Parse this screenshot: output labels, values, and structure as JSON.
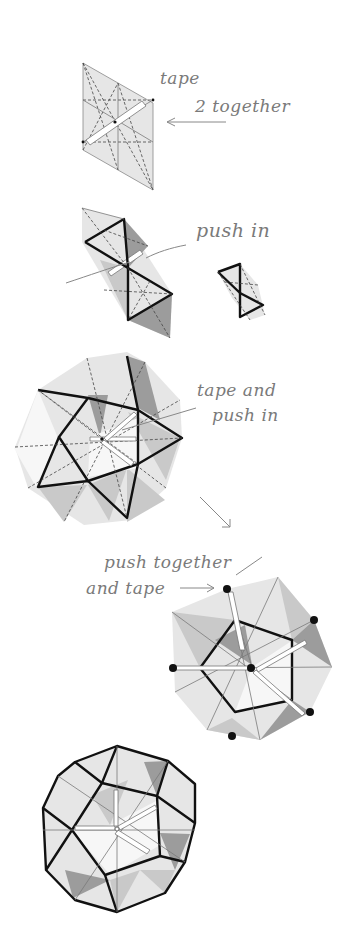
{
  "diagram": {
    "type": "assembly instructions",
    "steps": [
      {
        "id": 1,
        "labels": [
          "tape",
          "2 together"
        ]
      },
      {
        "id": 2,
        "labels": [
          "push in"
        ]
      },
      {
        "id": 3,
        "labels": [
          "tape and",
          "push in"
        ]
      },
      {
        "id": 4,
        "labels": [
          "push together",
          "and tape"
        ]
      },
      {
        "id": 5,
        "labels": []
      }
    ]
  },
  "colors": {
    "light_face": "#e4e4e4",
    "mid_face": "#c8c8c8",
    "dark_face": "#9a9a9a",
    "line": "#555555",
    "bold_line": "#111111",
    "annotation": "#7a7a7a"
  }
}
